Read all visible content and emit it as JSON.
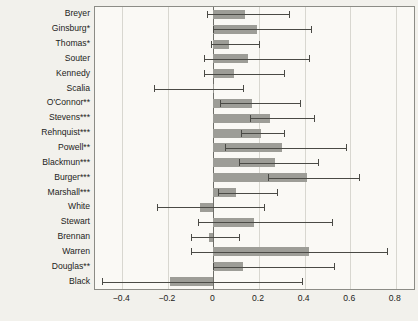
{
  "chart_data": {
    "type": "bar",
    "orientation": "horizontal",
    "title": "",
    "xlabel": "",
    "ylabel": "",
    "xlim": [
      -0.52,
      0.88
    ],
    "xticks": [
      -0.4,
      -0.2,
      0,
      0.2,
      0.4,
      0.6,
      0.8
    ],
    "xtick_labels": [
      "−0.4",
      "−0.2",
      "0",
      "0.2",
      "0.4",
      "0.6",
      "0.8"
    ],
    "grid": true,
    "grid_axis": "x",
    "legend": null,
    "zero_reference_line": 0,
    "bar_color": "#9d9d97",
    "error_color": "#4a4a45",
    "plot_background": "#faf9f5",
    "figure_background": "#f2f1ec",
    "categories": [
      "Breyer",
      "Ginsburg*",
      "Thomas*",
      "Souter",
      "Kennedy",
      "Scalia",
      "O'Connor**",
      "Stevens***",
      "Rehnquist***",
      "Powell**",
      "Blackmun***",
      "Burger***",
      "Marshall***",
      "White",
      "Stewart",
      "Brennan",
      "Warren",
      "Douglas**",
      "Black"
    ],
    "values": [
      0.14,
      0.19,
      0.07,
      0.15,
      0.09,
      0.0,
      0.17,
      0.25,
      0.21,
      0.3,
      0.27,
      0.41,
      0.1,
      -0.06,
      0.18,
      -0.02,
      0.42,
      0.13,
      -0.19
    ],
    "ci_low": [
      -0.03,
      0.0,
      -0.01,
      -0.04,
      -0.04,
      -0.26,
      0.03,
      0.16,
      0.12,
      0.05,
      0.11,
      0.24,
      0.02,
      -0.25,
      -0.07,
      -0.1,
      -0.1,
      0.0,
      -0.49
    ],
    "ci_high": [
      0.33,
      0.43,
      0.2,
      0.42,
      0.31,
      0.13,
      0.38,
      0.44,
      0.31,
      0.58,
      0.46,
      0.64,
      0.28,
      0.22,
      0.52,
      0.11,
      0.76,
      0.53,
      0.39
    ]
  }
}
